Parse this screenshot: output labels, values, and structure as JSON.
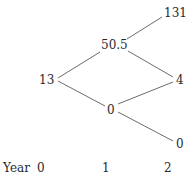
{
  "tree": {
    "nodes": [
      {
        "id": "n0",
        "label": "13",
        "year": 0
      },
      {
        "id": "n1u",
        "label": "50.5",
        "year": 1
      },
      {
        "id": "n1d",
        "label": "0",
        "year": 1
      },
      {
        "id": "n2uu",
        "label": "131",
        "year": 2
      },
      {
        "id": "n2ud",
        "label": "4",
        "year": 2
      },
      {
        "id": "n2dd",
        "label": "0",
        "year": 2
      }
    ],
    "edges": [
      {
        "from": "n0",
        "to": "n1u"
      },
      {
        "from": "n0",
        "to": "n1d"
      },
      {
        "from": "n1u",
        "to": "n2uu"
      },
      {
        "from": "n1u",
        "to": "n2ud"
      },
      {
        "from": "n1d",
        "to": "n2ud"
      },
      {
        "from": "n1d",
        "to": "n2dd"
      }
    ],
    "line_color": "#6b6b6b"
  },
  "axis": {
    "label": "Year",
    "ticks": [
      "0",
      "1",
      "2"
    ]
  }
}
